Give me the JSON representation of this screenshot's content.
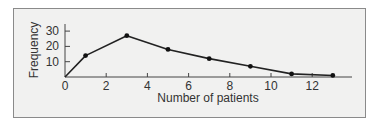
{
  "chart_data": {
    "type": "line",
    "title": "",
    "xlabel": "Number of patients",
    "ylabel": "Frequency",
    "xlim": [
      0,
      14
    ],
    "ylim": [
      0,
      32
    ],
    "x_ticks": [
      0,
      2,
      4,
      6,
      8,
      10,
      12
    ],
    "y_ticks": [
      10,
      20,
      30
    ],
    "grid": false,
    "legend": null,
    "series": [
      {
        "name": "Frequency polygon",
        "x": [
          0,
          1,
          3,
          5,
          7,
          9,
          11,
          13
        ],
        "y": [
          0,
          14,
          27,
          18,
          12,
          7,
          2,
          1
        ],
        "markers": [
          false,
          true,
          true,
          true,
          true,
          true,
          true,
          true
        ]
      }
    ]
  },
  "labels": {
    "xlabel": "Number of patients",
    "ylabel": "Frequency",
    "x_ticks": [
      "0",
      "2",
      "4",
      "6",
      "8",
      "10",
      "12"
    ],
    "y_ticks": [
      "10",
      "20",
      "30"
    ]
  },
  "colors": {
    "frame_bg": "#f1f1f0",
    "frame_border": "#8a8a8a",
    "line": "#222222",
    "axis": "#444444",
    "text": "#333333"
  }
}
